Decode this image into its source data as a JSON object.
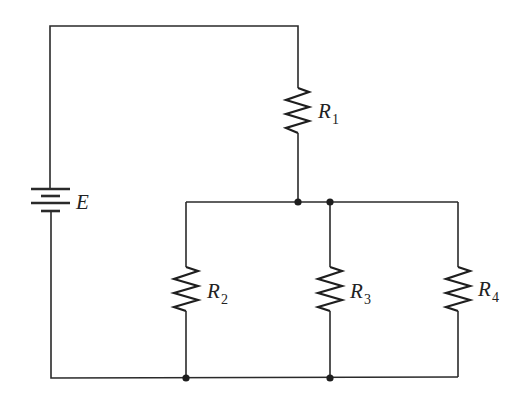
{
  "diagram": {
    "type": "circuit-schematic",
    "source": {
      "symbol": "E",
      "kind": "battery"
    },
    "resistors": [
      {
        "id": "R1",
        "letter": "R",
        "sub": "1",
        "position": "series-top"
      },
      {
        "id": "R2",
        "letter": "R",
        "sub": "2",
        "position": "parallel-left"
      },
      {
        "id": "R3",
        "letter": "R",
        "sub": "3",
        "position": "parallel-middle"
      },
      {
        "id": "R4",
        "letter": "R",
        "sub": "4",
        "position": "parallel-right"
      }
    ],
    "junction_count": 4,
    "colors": {
      "line": "#2a2a2a",
      "background": "#ffffff"
    }
  }
}
